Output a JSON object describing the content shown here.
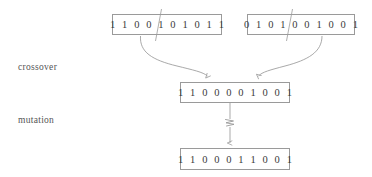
{
  "diagram": {
    "background_color": "#ffffff",
    "line_color": "#9a9a9a",
    "text_color": "#3a3a3a",
    "label_color": "#555555",
    "labels": {
      "crossover": "crossover",
      "mutation": "mutation"
    },
    "chromosomes": {
      "parent1": {
        "name": "parent-1",
        "bits": "1 1 0 0 1 0 1 0 1 1",
        "crossover_point": 4
      },
      "parent2": {
        "name": "parent-2",
        "bits": "0 1 0 1 0 0 1 0 0 1",
        "crossover_point": 4
      },
      "offspring": {
        "name": "offspring",
        "bits": "1 1 0 0 0 0 1 0 0 1"
      },
      "mutated": {
        "name": "mutated-offspring",
        "bits": "1 1 0 0 0 1 1 0 0 1"
      }
    },
    "connectors": {
      "crossover_left_arrow": "curved-arrow",
      "crossover_right_arrow": "curved-arrow",
      "mutation_arrow": "straight-arrow",
      "mutation_marker": "zigzag-icon"
    }
  }
}
